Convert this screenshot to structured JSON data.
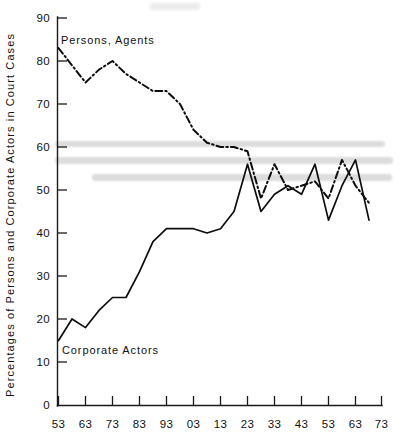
{
  "chart_data": {
    "type": "line",
    "title": "",
    "subtitle": "",
    "xlabel": "",
    "ylabel": "Percentages of Persons and Corporate Actors in Court Cases",
    "xlim": [
      0,
      12
    ],
    "ylim": [
      0,
      90
    ],
    "grid": false,
    "legend_position": "inline-annotation",
    "x_tick_labels": [
      "53",
      "63",
      "73",
      "83",
      "93",
      "03",
      "13",
      "23",
      "33",
      "43",
      "53",
      "63",
      "73"
    ],
    "y_tick_labels": [
      "0",
      "10",
      "20",
      "30",
      "40",
      "50",
      "60",
      "70",
      "80",
      "90"
    ],
    "y_ticks": [
      0,
      10,
      20,
      30,
      40,
      50,
      60,
      70,
      80,
      90
    ],
    "x": [
      "53",
      "58",
      "63",
      "68",
      "73",
      "78",
      "83",
      "88",
      "93",
      "98",
      "03",
      "08",
      "13",
      "18",
      "23",
      "28",
      "33",
      "38",
      "43",
      "48",
      "53",
      "58",
      "63",
      "68"
    ],
    "series": [
      {
        "name": "Persons, Agents",
        "style": "dash-dot",
        "label_x": "58",
        "label_y": 85,
        "values": [
          83,
          79,
          75,
          78,
          80,
          77,
          75,
          73,
          73,
          70,
          64,
          61,
          60,
          60,
          59,
          48,
          56,
          50,
          51,
          52,
          48,
          57,
          51,
          47
        ]
      },
      {
        "name": "Corporate Actors",
        "style": "solid",
        "label_x": "63",
        "label_y": 15,
        "values": [
          15,
          20,
          18,
          22,
          25,
          25,
          31,
          38,
          41,
          41,
          41,
          40,
          41,
          45,
          56,
          45,
          49,
          51,
          49,
          56,
          43,
          51,
          57,
          43
        ]
      }
    ],
    "annotations": [
      {
        "text": "Persons, Agents",
        "kind": "series-label"
      },
      {
        "text": "Corporate Actors",
        "kind": "series-label"
      }
    ]
  },
  "axis": {
    "y_title": "Percentages of Persons and Corporate Actors in Court Cases",
    "y_labels": [
      "90",
      "80",
      "70",
      "60",
      "50",
      "40",
      "30",
      "20",
      "10",
      "0"
    ],
    "x_labels": [
      "53",
      "63",
      "73",
      "83",
      "93",
      "03",
      "13",
      "23",
      "33",
      "43",
      "53",
      "63",
      "73"
    ]
  },
  "labels": {
    "persons": "Persons, Agents",
    "corporate": "Corporate Actors"
  },
  "colors": {
    "ink": "#0d0d0d",
    "axis": "#1a1a1a",
    "background": "#ffffff",
    "smudge": "#d6d6d6"
  }
}
